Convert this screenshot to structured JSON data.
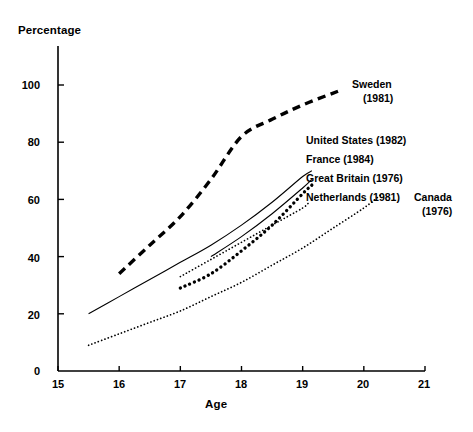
{
  "chart_data": {
    "type": "line",
    "title": "",
    "xlabel": "Age",
    "ylabel": "Percentage",
    "xlim": [
      15,
      21
    ],
    "ylim": [
      0,
      110
    ],
    "xticks": [
      15,
      16,
      17,
      18,
      19,
      20,
      21
    ],
    "yticks": [
      0,
      20,
      40,
      60,
      80,
      100
    ],
    "grid": false,
    "legend_position": "inline-right-of-line-ends",
    "series": [
      {
        "name": "Sweden",
        "year": "(1981)",
        "label": "Sweden",
        "style": "thick-dashed",
        "x": [
          16.0,
          16.5,
          17.0,
          17.5,
          18.0,
          18.5,
          19.0,
          19.6
        ],
        "y": [
          34,
          44,
          54,
          67,
          82,
          88,
          93,
          98
        ]
      },
      {
        "name": "United States",
        "year": "(1982)",
        "label": "United States  (1982)",
        "style": "solid-thin",
        "x": [
          15.5,
          16.0,
          16.5,
          17.0,
          17.5,
          18.0,
          18.5,
          19.0,
          19.15
        ],
        "y": [
          20,
          26,
          32,
          38,
          44,
          51,
          59,
          68,
          70
        ]
      },
      {
        "name": "France",
        "year": "(1984)",
        "label": "France (1984)",
        "style": "solid-thin",
        "x": [
          17.5,
          18.0,
          18.5,
          19.0,
          19.15
        ],
        "y": [
          40,
          47,
          55,
          64,
          67
        ]
      },
      {
        "name": "Great Britain",
        "year": "(1976)",
        "label": "Great Britain  (1976)",
        "style": "thick-dotted",
        "x": [
          17.0,
          17.5,
          18.0,
          18.5,
          19.0,
          19.15
        ],
        "y": [
          29,
          34,
          42,
          51,
          62,
          65
        ]
      },
      {
        "name": "Netherlands",
        "year": "(1981)",
        "label": "Netherlands (1981)",
        "style": "fine-dotted",
        "x": [
          17.0,
          17.5,
          18.0,
          18.5,
          19.0,
          19.1
        ],
        "y": [
          33,
          39,
          45,
          51,
          57,
          59
        ]
      },
      {
        "name": "Canada",
        "year": "(1976)",
        "label": "Canada",
        "style": "fine-dotted",
        "x": [
          15.5,
          16.0,
          16.5,
          17.0,
          17.5,
          18.0,
          18.5,
          19.0,
          19.5,
          20.0,
          20.3
        ],
        "y": [
          9,
          13,
          17,
          21,
          26,
          31,
          37,
          43,
          50,
          57,
          62
        ]
      }
    ],
    "colors": {
      "axis": "#000000",
      "line": "#000000",
      "background": "#ffffff"
    }
  },
  "axis": {
    "y_title": "Percentage",
    "x_title": "Age",
    "y_tick_labels": [
      "100",
      "80",
      "60",
      "40",
      "20",
      "0"
    ],
    "x_tick_labels": [
      "15",
      "16",
      "17",
      "18",
      "19",
      "20",
      "21"
    ]
  },
  "labels": {
    "sweden_name": "Sweden",
    "sweden_year": "(1981)",
    "united_states": "United States  (1982)",
    "france": "France (1984)",
    "great_britain": "Great Britain  (1976)",
    "netherlands": "Netherlands (1981)",
    "canada_name": "Canada",
    "canada_year": "(1976)"
  }
}
